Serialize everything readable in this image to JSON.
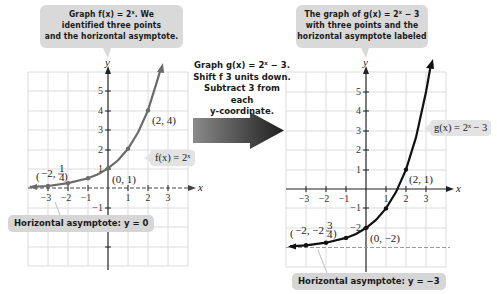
{
  "callouts": {
    "left_top": [
      "Graph f(x) = 2ˣ. We",
      "identified three points",
      "and the horizontal asymptote."
    ],
    "right_top": [
      "The graph of g(x) = 2ˣ − 3",
      "with three points and the",
      "horizontal asymptote labeled"
    ],
    "middle": [
      "Graph g(x) = 2ˣ − 3.",
      "Shift f 3 units down.",
      "Subtract 3 from each",
      "y-coordinate."
    ]
  },
  "left_graph": {
    "function_label": "f(x) = 2ˣ",
    "asymptote_label": "Horizontal asymptote: y = 0",
    "points": [
      {
        "label": "(−2, 1/4)",
        "x": -2,
        "y": 0.25
      },
      {
        "label": "(0, 1)",
        "x": 0,
        "y": 1
      },
      {
        "label": "(2, 4)",
        "x": 2,
        "y": 4
      }
    ],
    "x_ticks": [
      "−3",
      "−2",
      "−1",
      "1",
      "2",
      "3"
    ],
    "y_ticks": [
      "5",
      "4",
      "3",
      "2",
      "1",
      "−1"
    ],
    "x_axis_label": "x",
    "y_axis_label": "y"
  },
  "right_graph": {
    "function_label": "g(x) = 2ˣ − 3",
    "asymptote_label": "Horizontal asymptote: y = −3",
    "points": [
      {
        "label": "(−2, −2 3/4)",
        "x": -2,
        "y": -2.75
      },
      {
        "label": "(0, −2)",
        "x": 0,
        "y": -2
      },
      {
        "label": "(2, 1)",
        "x": 2,
        "y": 1
      }
    ],
    "x_ticks": [
      "−3",
      "−2",
      "−1",
      "1",
      "2",
      "3"
    ],
    "y_ticks": [
      "5",
      "4",
      "3",
      "2",
      "1",
      "−1",
      "−2"
    ],
    "x_axis_label": "x",
    "y_axis_label": "y"
  },
  "colors": {
    "curve_left": "#6b6b6b",
    "curve_right": "#111111",
    "callout_bg": "#d9d9d9",
    "arrow_dark": "#2a2a2a",
    "grid": "#dcdcdc"
  }
}
